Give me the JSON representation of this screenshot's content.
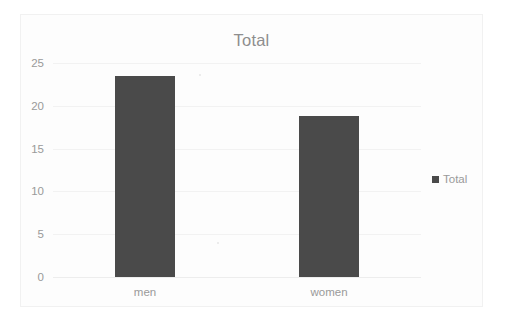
{
  "chart_data": {
    "type": "bar",
    "title": "Total",
    "categories": [
      "men",
      "women"
    ],
    "values": [
      23.5,
      18.8
    ],
    "series": [
      {
        "name": "Total",
        "values": [
          23.5,
          18.8
        ]
      }
    ],
    "xlabel": "",
    "ylabel": "",
    "ylim": [
      0,
      25
    ],
    "yticks": [
      0,
      5,
      10,
      15,
      20,
      25
    ],
    "ytick_labels": [
      "0",
      "5",
      "10",
      "15",
      "20",
      "25"
    ],
    "grid": true,
    "legend": {
      "position": "right",
      "entries": [
        "Total"
      ]
    },
    "colors": {
      "bar": "#4a4a4a",
      "text": "#9a9a9a",
      "title": "#8e8e8e",
      "gridline": "#f2f2f2",
      "background": "#fdfdfd",
      "frame_border": "#f1f1f1"
    }
  }
}
